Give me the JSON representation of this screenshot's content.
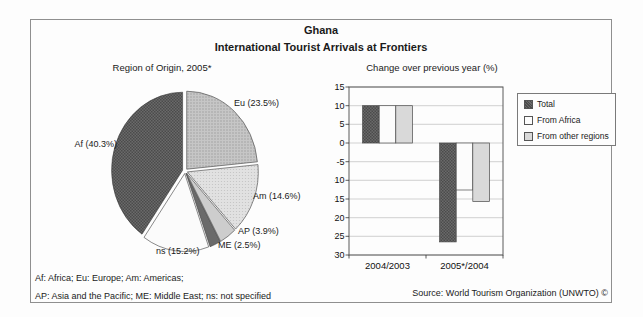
{
  "header": {
    "title": "Ghana",
    "subtitle": "International Tourist Arrivals at Frontiers"
  },
  "chart_data": [
    {
      "type": "pie",
      "title": "Region of Origin, 2005*",
      "unit": "%",
      "order": "clockwise-from-top",
      "slices": [
        {
          "label": "Eu",
          "display": "Eu (23.5%)",
          "value": 23.5,
          "color": "#bfbfbf",
          "texture": "dots-medium"
        },
        {
          "label": "Am",
          "display": "Am (14.6%)",
          "value": 14.6,
          "color": "#dcdcdc",
          "texture": "dots-light"
        },
        {
          "label": "AP",
          "display": "AP (3.9%)",
          "value": 3.9,
          "color": "#cdcdcd",
          "texture": "solid"
        },
        {
          "label": "ME",
          "display": "ME (2.5%)",
          "value": 2.5,
          "color": "#6a6a6a",
          "texture": "solid"
        },
        {
          "label": "ns",
          "display": "ns (15.2%)",
          "value": 15.2,
          "color": "#fbfbfb",
          "texture": "solid"
        },
        {
          "label": "Af",
          "display": "Af (40.3%)",
          "value": 40.3,
          "color": "#5f5f5f",
          "texture": "hatch-dark"
        }
      ]
    },
    {
      "type": "bar",
      "title": "Change over previous year (%)",
      "categories": [
        "2004/2003",
        "2005*/2004"
      ],
      "series": [
        {
          "name": "Total",
          "values": [
            10,
            -26.5
          ],
          "color": "#6b6b6b",
          "texture": "hatch-dark"
        },
        {
          "name": "From Africa",
          "values": [
            10,
            -12.6
          ],
          "color": "#fcfcfc",
          "texture": "solid"
        },
        {
          "name": "From other regions",
          "values": [
            10,
            -15.7
          ],
          "color": "#d9d9d9",
          "texture": "solid"
        }
      ],
      "ylim": [
        -30,
        15
      ],
      "ytick_step": 5,
      "grid": true,
      "legend_position": "right"
    }
  ],
  "footnotes": [
    "Af: Africa; Eu: Europe; Am: Americas;",
    "AP: Asia and the Pacific; ME: Middle East; ns: not specified"
  ],
  "source": "Source: World Tourism Organization (UNWTO) ©"
}
